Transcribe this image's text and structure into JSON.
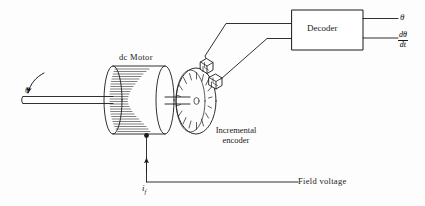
{
  "figure": {
    "type": "schematic-diagram",
    "background_color": "#fdfdfd",
    "line_color": "#1a1a1a"
  },
  "labels": {
    "motor": "dc Motor",
    "decoder": "Decoder",
    "encoder_line1": "Incremental",
    "encoder_line2": "encoder",
    "field_voltage": "Field voltage",
    "shaft_angle": "θ",
    "output_angle": "θ",
    "output_rate_numerator": "dθ",
    "output_rate_denominator": "dt",
    "field_current": "i",
    "field_current_subscript": "f"
  },
  "components": {
    "motor": {
      "name": "dc Motor",
      "shape": "hatched cylinder",
      "left_cap_x": 112,
      "right_cap_x": 165,
      "center_y": 100,
      "radius_y": 35
    },
    "encoder_disk": {
      "name": "Incremental encoder",
      "shape": "slotted ellipse disk",
      "center_x": 196,
      "center_y": 101,
      "rx": 20,
      "ry": 33,
      "slot_count": 16
    },
    "sensors": [
      {
        "name": "upper optical sensor",
        "x": 206,
        "y": 67
      },
      {
        "name": "lower optical sensor",
        "x": 216,
        "y": 82
      }
    ],
    "decoder_box": {
      "name": "Decoder",
      "x": 292,
      "y": 10,
      "width": 71,
      "height": 40
    },
    "shaft": {
      "name": "output shaft",
      "x_start": 22,
      "x_end": 112,
      "y": 100
    },
    "rotation_arrow": {
      "name": "theta rotation arrow",
      "direction": "counterclockwise"
    }
  },
  "connections": [
    {
      "from": "upper optical sensor",
      "to": "decoder input 1"
    },
    {
      "from": "lower optical sensor",
      "to": "decoder input 2"
    },
    {
      "from": "decoder output 1",
      "to": "θ"
    },
    {
      "from": "decoder output 2",
      "to": "dθ/dt"
    },
    {
      "from": "Field voltage",
      "to": "motor field winding",
      "label": "i_f"
    }
  ]
}
